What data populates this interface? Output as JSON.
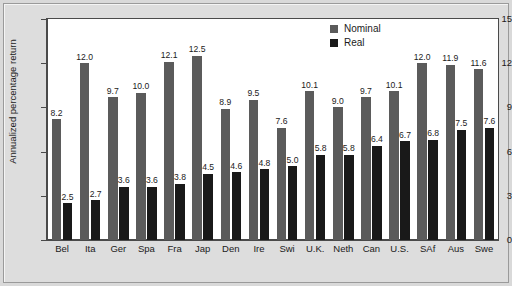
{
  "chart_data": {
    "type": "bar",
    "title": "",
    "xlabel": "",
    "ylabel": "Annualized percentage return",
    "ylim": [
      0,
      15
    ],
    "yticks": [
      "0",
      "3",
      "6",
      "9",
      "12",
      "15"
    ],
    "grid": false,
    "legend_position": "top-right",
    "categories": [
      "Bel",
      "Ita",
      "Ger",
      "Spa",
      "Fra",
      "Jap",
      "Den",
      "Ire",
      "Swi",
      "U.K.",
      "Neth",
      "Can",
      "U.S.",
      "SAf",
      "Aus",
      "Swe"
    ],
    "series": [
      {
        "name": "Nominal",
        "color": "#5b5b5b",
        "values": [
          8.2,
          12.0,
          9.7,
          10.0,
          12.1,
          12.5,
          8.9,
          9.5,
          7.6,
          10.1,
          9.0,
          9.7,
          10.1,
          12.0,
          11.9,
          11.6
        ],
        "labels": [
          "8.2",
          "12.0",
          "9.7",
          "10.0",
          "12.1",
          "12.5",
          "8.9",
          "9.5",
          "7.6",
          "10.1",
          "9.0",
          "9.7",
          "10.1",
          "12.0",
          "11.9",
          "11.6"
        ]
      },
      {
        "name": "Real",
        "color": "#191919",
        "values": [
          2.5,
          2.7,
          3.6,
          3.6,
          3.8,
          4.5,
          4.6,
          4.8,
          5.0,
          5.8,
          5.8,
          6.4,
          6.7,
          6.8,
          7.5,
          7.6
        ],
        "labels": [
          "2.5",
          "2.7",
          "3.6",
          "3.6",
          "3.8",
          "4.5",
          "4.6",
          "4.8",
          "5.0",
          "5.8",
          "5.8",
          "6.4",
          "6.7",
          "6.8",
          "7.5",
          "7.6"
        ]
      }
    ]
  },
  "legend": {
    "items": [
      {
        "label": "Nominal",
        "color": "#5b5b5b"
      },
      {
        "label": "Real",
        "color": "#191919"
      }
    ]
  }
}
